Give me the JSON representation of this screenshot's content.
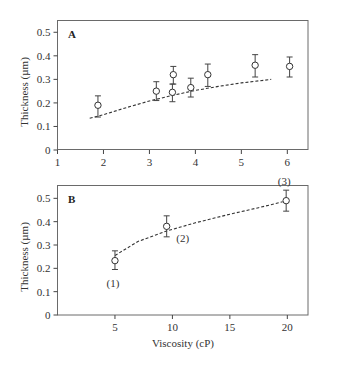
{
  "chart_data": [
    {
      "panel": "A",
      "type": "scatter",
      "title": "",
      "xlabel": "",
      "ylabel": "Thickness (µm)",
      "xlim": [
        1,
        6.45
      ],
      "ylim": [
        0,
        0.55
      ],
      "xticks": [
        1,
        2,
        3,
        4,
        5,
        6
      ],
      "yticks": [
        0,
        0.1,
        0.2,
        0.3,
        0.4,
        0.5
      ],
      "grid": false,
      "series": [
        {
          "name": "measured",
          "style": "open-circle-with-errorbars",
          "points": [
            {
              "x": 1.88,
              "y": 0.19,
              "ylo": 0.14,
              "yhi": 0.23
            },
            {
              "x": 3.15,
              "y": 0.25,
              "ylo": 0.21,
              "yhi": 0.29
            },
            {
              "x": 3.5,
              "y": 0.245,
              "ylo": 0.205,
              "yhi": 0.28
            },
            {
              "x": 3.52,
              "y": 0.32,
              "ylo": 0.28,
              "yhi": 0.355
            },
            {
              "x": 3.9,
              "y": 0.265,
              "ylo": 0.225,
              "yhi": 0.305
            },
            {
              "x": 4.27,
              "y": 0.32,
              "ylo": 0.27,
              "yhi": 0.365
            },
            {
              "x": 5.3,
              "y": 0.36,
              "ylo": 0.31,
              "yhi": 0.405
            },
            {
              "x": 6.05,
              "y": 0.355,
              "ylo": 0.31,
              "yhi": 0.395
            }
          ]
        },
        {
          "name": "fit",
          "style": "dashed-line",
          "points": [
            {
              "x": 1.7,
              "y": 0.135
            },
            {
              "x": 2.0,
              "y": 0.15
            },
            {
              "x": 2.5,
              "y": 0.18
            },
            {
              "x": 3.0,
              "y": 0.208
            },
            {
              "x": 3.5,
              "y": 0.232
            },
            {
              "x": 4.0,
              "y": 0.253
            },
            {
              "x": 4.5,
              "y": 0.27
            },
            {
              "x": 5.0,
              "y": 0.285
            },
            {
              "x": 5.65,
              "y": 0.3
            }
          ]
        }
      ],
      "annotations": [
        {
          "text": "A",
          "x": 1.25,
          "y": 0.5
        }
      ]
    },
    {
      "panel": "B",
      "type": "scatter",
      "title": "",
      "xlabel": "Viscosity (cP)",
      "ylabel": "Thickness (µm)",
      "xlim": [
        0,
        21.8
      ],
      "ylim": [
        0,
        0.555
      ],
      "xticks": [
        5,
        10,
        15,
        20
      ],
      "yticks": [
        0,
        0.1,
        0.2,
        0.3,
        0.4,
        0.5
      ],
      "grid": false,
      "series": [
        {
          "name": "measured",
          "style": "open-circle-with-errorbars",
          "points": [
            {
              "x": 5.0,
              "y": 0.233,
              "ylo": 0.195,
              "yhi": 0.275,
              "label": "(1)"
            },
            {
              "x": 9.5,
              "y": 0.38,
              "ylo": 0.335,
              "yhi": 0.425,
              "label": "(2)"
            },
            {
              "x": 19.9,
              "y": 0.49,
              "ylo": 0.445,
              "yhi": 0.535,
              "label": "(3)"
            }
          ]
        },
        {
          "name": "fit",
          "style": "dashed-line",
          "points": [
            {
              "x": 5.0,
              "y": 0.255
            },
            {
              "x": 7.0,
              "y": 0.315
            },
            {
              "x": 9.5,
              "y": 0.36
            },
            {
              "x": 12.0,
              "y": 0.395
            },
            {
              "x": 15.0,
              "y": 0.432
            },
            {
              "x": 17.5,
              "y": 0.46
            },
            {
              "x": 19.6,
              "y": 0.485
            }
          ]
        }
      ],
      "annotations": [
        {
          "text": "B",
          "x": 1.0,
          "y": 0.5
        }
      ]
    }
  ],
  "panels": {
    "a": {
      "label": "A",
      "ylabel": "Thickness (µm)",
      "xticks": [
        "1",
        "2",
        "3",
        "4",
        "5",
        "6"
      ],
      "yticks": [
        "0",
        "0.1",
        "0.2",
        "0.3",
        "0.4",
        "0.5"
      ]
    },
    "b": {
      "label": "B",
      "ylabel": "Thickness (µm)",
      "xlabel": "Viscosity (cP)",
      "xticks": [
        "5",
        "10",
        "15",
        "20"
      ],
      "yticks": [
        "0",
        "0.1",
        "0.2",
        "0.3",
        "0.4",
        "0.5"
      ],
      "point_labels": [
        "(1)",
        "(2)",
        "(3)"
      ]
    }
  }
}
